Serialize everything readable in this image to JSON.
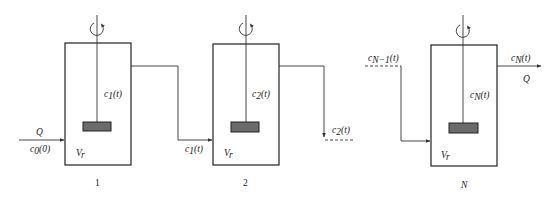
{
  "diagram": {
    "title": "",
    "type": "CSTR cascade (N stirred tanks in series)",
    "inlet": {
      "flow_label": "Q",
      "conc_label": "c",
      "conc_sub": "0",
      "conc_arg": "(0)"
    },
    "outlet": {
      "flow_label": "Q",
      "conc_label": "c",
      "conc_sub": "N",
      "conc_arg": "(t)"
    },
    "tanks": [
      {
        "index_label": "1",
        "volume_label": "V",
        "volume_sub": "r",
        "conc_label": "c",
        "conc_sub": "1",
        "conc_arg": "(t)"
      },
      {
        "index_label": "2",
        "volume_label": "V",
        "volume_sub": "r",
        "conc_label": "c",
        "conc_sub": "2",
        "conc_arg": "(t)"
      },
      {
        "index_label": "N",
        "volume_label": "V",
        "volume_sub": "r",
        "conc_label": "c",
        "conc_sub": "N",
        "conc_arg": "(t)"
      }
    ],
    "connections": [
      {
        "from": "1",
        "to": "2",
        "conc_label": "c",
        "conc_sub": "1",
        "conc_arg": "(t)"
      },
      {
        "from": "2",
        "to": "...",
        "conc_label": "c",
        "conc_sub": "2",
        "conc_arg": "(t)",
        "continuation": "dashed"
      },
      {
        "from": "...",
        "to": "N",
        "conc_label": "c",
        "conc_sub": "N−1",
        "conc_arg": "(t)",
        "continuation": "dashed"
      }
    ],
    "colors": {
      "stroke": "#222222",
      "impeller": "#6b6b6b",
      "background": "#ffffff"
    }
  }
}
